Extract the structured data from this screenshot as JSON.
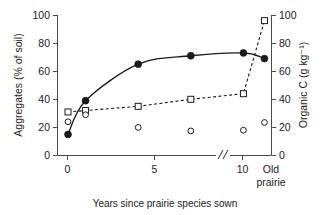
{
  "chart_data": {
    "type": "scatter",
    "title": "",
    "xlabel": "Years since prairie species sown",
    "ylabel": "Aggregates (% of soil)",
    "y2label": "Organic C (g kg⁻¹)",
    "xlim": [
      -0.6,
      11.6
    ],
    "ylim": [
      0,
      100
    ],
    "y2lim": [
      0,
      100
    ],
    "grid": false,
    "legend": "none",
    "axis_break": {
      "present": true,
      "symbol": "//",
      "between": [
        "10",
        "Old prairie"
      ]
    },
    "x_tick_labels": [
      "0",
      "5",
      "10",
      "Old\nprairie"
    ],
    "x_tick_values": [
      0,
      5,
      10,
      11.2
    ],
    "y_tick_labels": [
      "0",
      "20",
      "40",
      "60",
      "80",
      "100"
    ],
    "y_tick_values": [
      0,
      20,
      40,
      60,
      80,
      100
    ],
    "y2_tick_labels": [
      "0",
      "20",
      "40",
      "60",
      "80",
      "100"
    ],
    "y2_tick_values": [
      0,
      20,
      40,
      60,
      80,
      100
    ],
    "x_categories": [
      "0",
      "1",
      "4",
      "7",
      "10",
      "Old prairie"
    ],
    "series": [
      {
        "name": "Aggregates (% of soil)",
        "marker": "filled-circle",
        "line": "solid",
        "axis": "left",
        "x": [
          0,
          1,
          4,
          7,
          10,
          11.2
        ],
        "values": [
          15,
          39,
          65,
          71,
          73,
          69
        ]
      },
      {
        "name": "Organic C (g kg⁻¹)",
        "marker": "open-square",
        "line": "dashed",
        "axis": "right",
        "x": [
          0,
          1,
          4,
          7,
          10,
          11.2
        ],
        "values": [
          31,
          32,
          35,
          40,
          44,
          96
        ]
      },
      {
        "name": "Open circle series",
        "marker": "open-circle",
        "line": "none",
        "axis": "left",
        "x": [
          0,
          1,
          4,
          7,
          10,
          11.2
        ],
        "values": [
          24,
          29,
          20,
          17.5,
          18,
          23.5
        ]
      }
    ],
    "colors": {
      "ink": "#1a1a1a",
      "marker_fill": "#1a1a1a",
      "marker_open": "#ffffff",
      "background": "#ffffff"
    }
  },
  "axes": {
    "left_title": "Aggregates (% of soil)",
    "right_title": "Organic C (g kg⁻¹)",
    "x_title": "Years since prairie species sown",
    "x_labels": [
      "0",
      "5",
      "10"
    ],
    "x_old_line1": "Old",
    "x_old_line2": "prairie",
    "y_labels": [
      "100",
      "80",
      "60",
      "40",
      "20",
      "0"
    ],
    "y2_labels": [
      "100",
      "80",
      "60",
      "40",
      "20",
      "0"
    ]
  }
}
